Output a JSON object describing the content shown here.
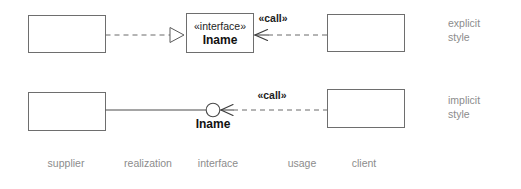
{
  "diagram": {
    "colors": {
      "background": "#ffffff",
      "box_stroke": "#6e6e6e",
      "line": "#4a4a4a",
      "dashed_line": "#6a6a6a",
      "text": "#111111",
      "annotation_text": "#8c8c8c"
    },
    "rows": [
      {
        "id": "explicit",
        "style_note_line1": "explicit",
        "style_note_line2": "style",
        "interface_stereotype": "«interface»",
        "interface_name": "Iname",
        "usage_stereotype": "«call»"
      },
      {
        "id": "implicit",
        "style_note_line1": "implicit",
        "style_note_line2": "style",
        "interface_name": "Iname",
        "usage_stereotype": "«call»"
      }
    ],
    "legend": [
      {
        "id": "supplier",
        "label": "supplier"
      },
      {
        "id": "realization",
        "label": "realization"
      },
      {
        "id": "interface",
        "label": "interface"
      },
      {
        "id": "usage",
        "label": "usage"
      },
      {
        "id": "client",
        "label": "client"
      }
    ]
  }
}
